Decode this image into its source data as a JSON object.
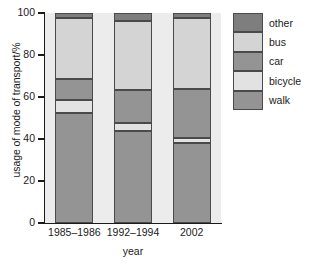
{
  "chart_data": {
    "type": "bar",
    "subtype": "stacked-bar-100-percent",
    "title": "",
    "xlabel": "year",
    "ylabel": "usage of mode of transport/%",
    "categories": [
      "1985–1986",
      "1992–1994",
      "2002"
    ],
    "ylim": [
      0,
      100
    ],
    "yticks": [
      0,
      20,
      40,
      60,
      80,
      100
    ],
    "ytick_labels": [
      "0",
      "20",
      "40",
      "60",
      "80",
      "100"
    ],
    "grid": false,
    "legend_position": "right",
    "legend_order_top_to_bottom": [
      "other",
      "bus",
      "car",
      "bicycle",
      "walk"
    ],
    "stack_order_bottom_to_top": [
      "walk",
      "bicycle",
      "car",
      "bus",
      "other"
    ],
    "series": [
      {
        "name": "walk",
        "color": "#949494",
        "values": [
          52.5,
          44.0,
          38.0
        ]
      },
      {
        "name": "bicycle",
        "color": "#e2e2e2",
        "values": [
          6.0,
          3.5,
          2.5
        ]
      },
      {
        "name": "car",
        "color": "#949494",
        "values": [
          10.0,
          16.0,
          23.5
        ]
      },
      {
        "name": "bus",
        "color": "#d4d4d4",
        "values": [
          29.0,
          32.5,
          33.5
        ]
      },
      {
        "name": "other",
        "color": "#7e7e7e",
        "values": [
          2.5,
          4.0,
          2.5
        ]
      }
    ],
    "cumulative_tops": {
      "1985–1986": {
        "walk": 52.5,
        "bicycle": 58.5,
        "car": 68.5,
        "bus": 97.5,
        "other": 100
      },
      "1992–1994": {
        "walk": 44.0,
        "bicycle": 47.5,
        "car": 63.5,
        "bus": 96.0,
        "other": 100
      },
      "2002": {
        "walk": 38.0,
        "bicycle": 40.5,
        "car": 64.0,
        "bus": 97.5,
        "other": 100
      }
    },
    "colors": {
      "other": "#7e7e7e",
      "bus": "#d4d4d4",
      "car": "#949494",
      "bicycle": "#e2e2e2",
      "walk": "#949494",
      "plot_background": "#ececec",
      "axis": "#1b1b1b",
      "segment_border": "#4a4a4a"
    }
  },
  "legend": {
    "items": [
      {
        "label": "other",
        "color": "#7e7e7e"
      },
      {
        "label": "bus",
        "color": "#d4d4d4"
      },
      {
        "label": "car",
        "color": "#949494"
      },
      {
        "label": "bicycle",
        "color": "#e2e2e2"
      },
      {
        "label": "walk",
        "color": "#949494"
      }
    ]
  }
}
